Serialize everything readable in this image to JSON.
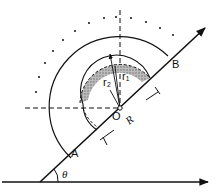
{
  "diagram": {
    "labels": {
      "A": "A",
      "B": "B",
      "O": "O",
      "R": "R",
      "r1": "r₁",
      "r2": "r₂",
      "theta": "θ"
    },
    "colors": {
      "stroke": "#111111",
      "hatch": "#9a9a9a",
      "background": "#ffffff"
    }
  }
}
